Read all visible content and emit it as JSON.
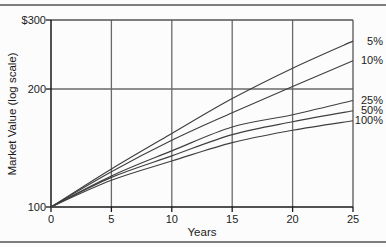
{
  "colors": {
    "background": "#fcfcfc",
    "rule": "#7d7d7d",
    "grid": "#6a6a6a",
    "border": "#555555",
    "axis": "#1a1a1a",
    "curve": "#3f3f3f",
    "text": "#1b1b1b"
  },
  "chart_data": {
    "type": "line",
    "title": "",
    "xlabel": "Years",
    "ylabel": "Market Value (log scale)",
    "y_scale": "log",
    "xlim": [
      0,
      25
    ],
    "ylim": [
      100,
      300
    ],
    "x": [
      0,
      5,
      10,
      15,
      20,
      25
    ],
    "x_tick_labels": [
      "0",
      "5",
      "10",
      "15",
      "20",
      "25"
    ],
    "y_ticks": [
      {
        "value": 100,
        "label": "100"
      },
      {
        "value": 200,
        "label": "200"
      },
      {
        "value": 300,
        "label": "$300"
      }
    ],
    "gridlines": {
      "vertical_at_x": [
        5,
        10,
        15,
        20
      ],
      "horizontal_at_y": [
        200
      ]
    },
    "legend_position": "right-edge-labels",
    "series": [
      {
        "name": "5%",
        "values": [
          100,
          125,
          154,
          189,
          226,
          265
        ]
      },
      {
        "name": "10%",
        "values": [
          100,
          123,
          148,
          174,
          203,
          236
        ]
      },
      {
        "name": "25%",
        "values": [
          100,
          120,
          139,
          160,
          172,
          187
        ]
      },
      {
        "name": "50%",
        "values": [
          100,
          119,
          135,
          153,
          165,
          176
        ]
      },
      {
        "name": "100%",
        "values": [
          100,
          117,
          131,
          146,
          157,
          166
        ]
      }
    ]
  }
}
